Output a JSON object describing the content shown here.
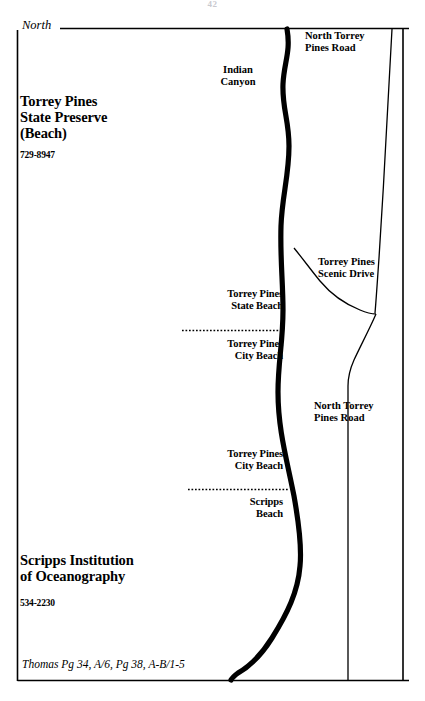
{
  "page": {
    "number": "42",
    "width": 425,
    "height": 701,
    "background_color": "#ffffff",
    "ink_color": "#000000"
  },
  "compass": {
    "label": "North"
  },
  "places": {
    "park": {
      "name": "Torrey Pines\nState Preserve\n(Beach)",
      "phone": "729-8947"
    },
    "institution": {
      "name": "Scripps Institution\nof Oceanography",
      "phone": "534-2230"
    }
  },
  "beach_segments": [
    {
      "id": "torrey-pines-state-beach",
      "label": "Torrey Pines\nState Beach"
    },
    {
      "id": "torrey-pines-city-beach-north",
      "label": "Torrey Pines\nCity Beach"
    },
    {
      "id": "torrey-pines-city-beach-south",
      "label": "Torrey Pines\nCity Beach"
    },
    {
      "id": "scripps-beach",
      "label": "Scripps\nBeach"
    }
  ],
  "features": {
    "indian_canyon": "Indian\nCanyon"
  },
  "roads": [
    {
      "id": "north-torrey-pines-road-north",
      "label": "North Torrey\nPines Road"
    },
    {
      "id": "torrey-pines-scenic-drive",
      "label": "Torrey Pines\nScenic Drive"
    },
    {
      "id": "north-torrey-pines-road-south",
      "label": "North Torrey\nPines Road"
    }
  ],
  "footer": {
    "thomas_guide": "Thomas Pg 34, A/6, Pg 38, A-B/1-5"
  }
}
